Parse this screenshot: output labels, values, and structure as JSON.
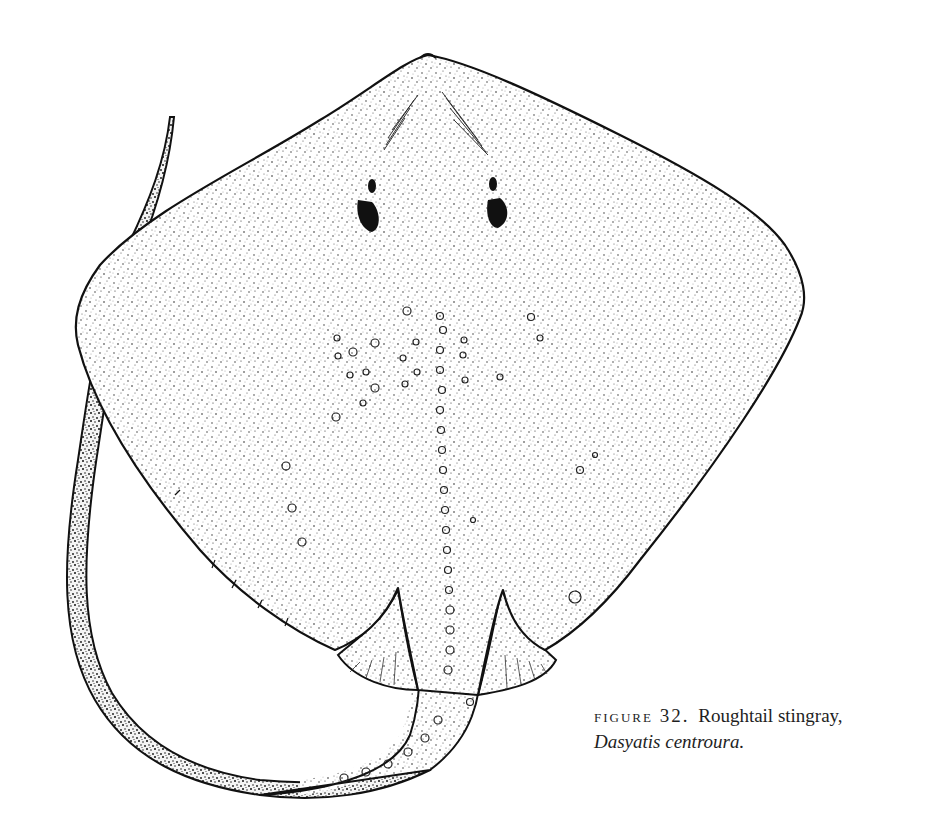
{
  "figure": {
    "style": "stipple pen-and-ink drawing",
    "ink_color": "#111111",
    "paper_color": "#ffffff"
  },
  "caption": {
    "label": "FIGURE 32.",
    "common_name": "Roughtail stingray,",
    "scientific_name": "Dasyatis centroura."
  }
}
